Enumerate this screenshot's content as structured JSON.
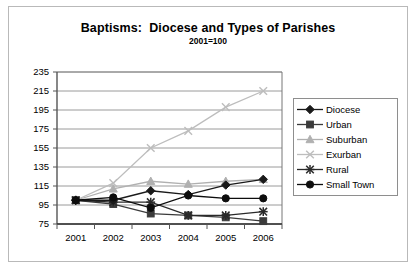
{
  "chart_data": {
    "type": "line",
    "title": "Baptisms:  Diocese and Types of Parishes",
    "subtitle": "2001=100",
    "xlabel": "",
    "ylabel": "",
    "categories": [
      "2001",
      "2002",
      "2003",
      "2004",
      "2005",
      "2006"
    ],
    "ylim": [
      75,
      235
    ],
    "ytick_step": 20,
    "yticks": [
      "235",
      "215",
      "195",
      "175",
      "155",
      "135",
      "115",
      "95",
      "75"
    ],
    "grid": true,
    "legend_position": "right",
    "series": [
      {
        "name": "Diocese",
        "marker": "diamond",
        "color": "#1a1a1a",
        "values": [
          100,
          100,
          110,
          106,
          116,
          122
        ]
      },
      {
        "name": "Urban",
        "marker": "square",
        "color": "#3b3b3b",
        "values": [
          100,
          96,
          86,
          84,
          82,
          78
        ]
      },
      {
        "name": "Suburban",
        "marker": "triangle",
        "color": "#b0b0b0",
        "values": [
          100,
          112,
          120,
          117,
          120,
          122
        ]
      },
      {
        "name": "Exurban",
        "marker": "x",
        "color": "#bdbdbd",
        "values": [
          100,
          118,
          155,
          173,
          198,
          215
        ]
      },
      {
        "name": "Rural",
        "marker": "star",
        "color": "#2a2a2a",
        "values": [
          100,
          98,
          98,
          84,
          84,
          88
        ]
      },
      {
        "name": "Small Town",
        "marker": "circle",
        "color": "#0d0d0d",
        "values": [
          100,
          103,
          92,
          105,
          102,
          102
        ]
      }
    ]
  },
  "legend": {
    "entries": [
      "Diocese",
      "Urban",
      "Suburban",
      "Exurban",
      "Rural",
      "Small Town"
    ]
  }
}
